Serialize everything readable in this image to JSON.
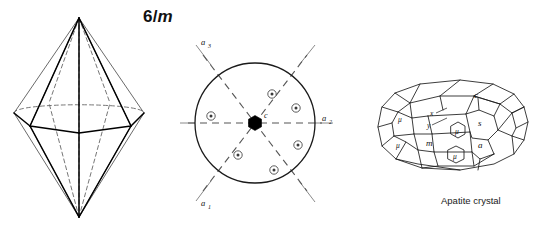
{
  "title": {
    "number": "6",
    "slash": "/",
    "mirror": "m",
    "full": "6/m"
  },
  "caption": {
    "text": "Apatite crystal"
  },
  "panels": {
    "left": {
      "name": "hexagonal-bipyramid",
      "description": "hexagonal bipyramid form"
    },
    "center": {
      "name": "stereogram",
      "description": "stereographic projection of point group 6/m"
    },
    "right": {
      "name": "apatite-crystal-drawing",
      "description": "apatite crystal habit drawing"
    }
  },
  "stereogram": {
    "center_symbol": "hexagon-filled-6fold",
    "center_label": "c",
    "axes": [
      {
        "id": "a1",
        "letter": "a",
        "sub": "1",
        "label": "a₁",
        "angle_deg": 240
      },
      {
        "id": "a2",
        "letter": "a",
        "sub": "2",
        "label": "a₂",
        "angle_deg": 0
      },
      {
        "id": "a3",
        "letter": "a",
        "sub": "3",
        "label": "a₃",
        "angle_deg": 120
      }
    ],
    "pole_count": 6,
    "pole_symbol": "circle-with-dot",
    "poles": [
      {
        "index": 1,
        "angle_deg": 60,
        "radius_frac": 0.56
      },
      {
        "index": 2,
        "angle_deg": 10,
        "radius_frac": 0.7
      },
      {
        "index": 3,
        "angle_deg": 310,
        "radius_frac": 0.7
      },
      {
        "index": 4,
        "angle_deg": 250,
        "radius_frac": 0.56
      },
      {
        "index": 5,
        "angle_deg": 190,
        "radius_frac": 0.7
      },
      {
        "index": 6,
        "angle_deg": 130,
        "radius_frac": 0.7
      }
    ]
  },
  "crystal_faces": [
    {
      "id": "c",
      "label": "c",
      "x": 477,
      "y": 96
    },
    {
      "id": "x",
      "label": "x",
      "x": 431,
      "y": 113
    },
    {
      "id": "y",
      "label": "y",
      "x": 428,
      "y": 125
    },
    {
      "id": "s",
      "label": "s",
      "x": 468,
      "y": 123
    },
    {
      "id": "m",
      "label": "m",
      "x": 428,
      "y": 142
    },
    {
      "id": "a",
      "label": "a",
      "x": 472,
      "y": 145
    },
    {
      "id": "mu1",
      "label": "μ",
      "x": 451,
      "y": 128
    },
    {
      "id": "mu2",
      "label": "μ",
      "x": 455,
      "y": 158
    },
    {
      "id": "mu3",
      "label": "μ",
      "x": 370,
      "y": 118
    },
    {
      "id": "mu4",
      "label": "μ",
      "x": 368,
      "y": 143
    }
  ],
  "colors": {
    "ink": "#111111",
    "edge_solid": "#000000",
    "edge_hidden": "#666666",
    "axis_dash": "#555555",
    "axis_tail": "#8a8a8a",
    "background": "#ffffff"
  }
}
